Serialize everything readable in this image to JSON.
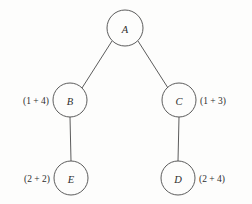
{
  "diagram": {
    "type": "tree",
    "title": "",
    "background_color": "#fdfdfc",
    "stroke_color": "#4a4a4a",
    "text_color": "#2e2e2e",
    "nodes": [
      {
        "id": "A",
        "label": "A",
        "cost_label": "",
        "cost_side": "none",
        "cx": 125,
        "cy": 28,
        "r": 18
      },
      {
        "id": "B",
        "label": "B",
        "cost_label": "(1 + 4)",
        "cost_side": "left",
        "cx": 70,
        "cy": 100,
        "r": 17
      },
      {
        "id": "C",
        "label": "C",
        "cost_label": "(1 + 3)",
        "cost_side": "right",
        "cx": 179,
        "cy": 100,
        "r": 17
      },
      {
        "id": "E",
        "label": "E",
        "cost_label": "(2 + 2)",
        "cost_side": "left",
        "cx": 71,
        "cy": 178,
        "r": 17
      },
      {
        "id": "D",
        "label": "D",
        "cost_label": "(2 + 4)",
        "cost_side": "right",
        "cx": 178,
        "cy": 178,
        "r": 17
      }
    ],
    "edges": [
      {
        "from": "A",
        "to": "B",
        "x1": 112,
        "y1": 41,
        "x2": 82,
        "y2": 88
      },
      {
        "from": "A",
        "to": "C",
        "x1": 138,
        "y1": 41,
        "x2": 168,
        "y2": 88
      },
      {
        "from": "B",
        "to": "E",
        "x1": 70,
        "y1": 117,
        "x2": 71,
        "y2": 161
      },
      {
        "from": "C",
        "to": "D",
        "x1": 179,
        "y1": 117,
        "x2": 178,
        "y2": 161
      }
    ]
  }
}
